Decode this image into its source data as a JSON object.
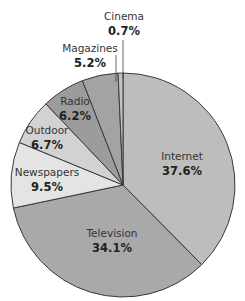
{
  "chart_data": {
    "type": "pie",
    "title": "",
    "start_angle_deg": 0,
    "direction": "clockwise",
    "categories": [
      "Internet",
      "Television",
      "Newspapers",
      "Outdoor",
      "Radio",
      "Magazines",
      "Cinema"
    ],
    "values": [
      37.6,
      34.1,
      9.5,
      6.7,
      6.2,
      5.2,
      0.7
    ],
    "value_labels": [
      "37.6%",
      "34.1%",
      "9.5%",
      "6.7%",
      "6.2%",
      "5.2%",
      "0.7%"
    ],
    "colors": [
      "#bdbdbd",
      "#a9a9a9",
      "#e4e4e4",
      "#d2d2d2",
      "#9c9c9c",
      "#a3a3a3",
      "#c4c4c4"
    ],
    "legend": "none (labels on/near slices)"
  },
  "labels": {
    "internet": {
      "name": "Internet",
      "value": "37.6%"
    },
    "television": {
      "name": "Television",
      "value": "34.1%"
    },
    "newspapers": {
      "name": "Newspapers",
      "value": "9.5%"
    },
    "outdoor": {
      "name": "Outdoor",
      "value": "6.7%"
    },
    "radio": {
      "name": "Radio",
      "value": "6.2%"
    },
    "magazines": {
      "name": "Magazines",
      "value": "5.2%"
    },
    "cinema": {
      "name": "Cinema",
      "value": "0.7%"
    }
  }
}
